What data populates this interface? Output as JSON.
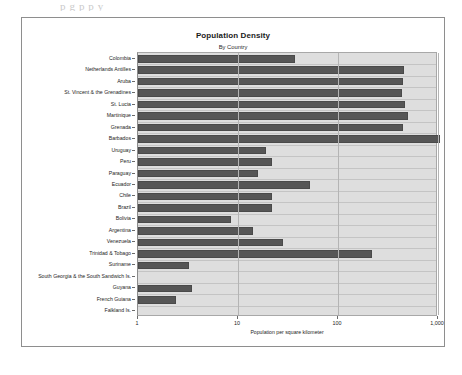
{
  "page": {
    "ghost_text": "p  g   p             p                   y_"
  },
  "chart_data": {
    "type": "bar",
    "orientation": "horizontal",
    "title": "Population Density",
    "subtitle": "By Country",
    "xlabel": "Population per square kilometer",
    "ylabel": "",
    "xscale": "log",
    "xlim": [
      1,
      1000
    ],
    "xticks": [
      1,
      10,
      100,
      1000
    ],
    "xtick_labels": [
      "1",
      "10",
      "100",
      "1,000"
    ],
    "grid": true,
    "legend": "none",
    "bar_color": "#565656",
    "plot_background": "#dedede",
    "categories": [
      "Colombia",
      "Netherlands Antilles",
      "Aruba",
      "St. Vincent & the Grenadines",
      "St. Lucia",
      "Martinique",
      "Grenada",
      "Barbados",
      "Uruguay",
      "Peru",
      "Paraguay",
      "Ecuador",
      "Chile",
      "Brazil",
      "Bolivia",
      "Argentina",
      "Venezuela",
      "Trinidad & Tobago",
      "Suriname",
      "South Georgia & the South Sandwich Is.",
      "Guyana",
      "French Guiana",
      "Falkland Is."
    ],
    "values": [
      37,
      455,
      450,
      440,
      470,
      500,
      445,
      1050,
      19,
      22,
      16,
      52,
      22,
      22,
      8.6,
      14,
      28,
      220,
      3.2,
      0,
      3.5,
      2.4,
      0
    ]
  }
}
